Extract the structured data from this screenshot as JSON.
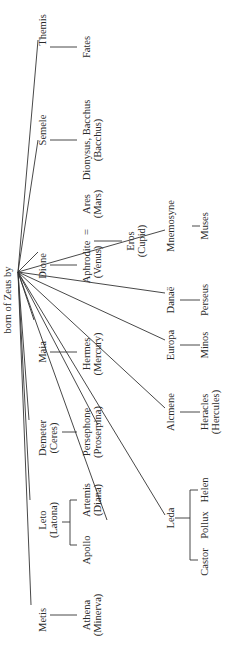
{
  "title": "born of Zeus by",
  "hub": {
    "x": 18,
    "y": 272
  },
  "mothers": [
    {
      "name": "Themis",
      "x": 42,
      "y": 30
    },
    {
      "name": "Semele",
      "x": 42,
      "y": 132
    },
    {
      "name": "Dione",
      "x": 42,
      "y": 246
    },
    {
      "name": "Maia",
      "x": 42,
      "y": 335
    },
    {
      "name": "Demeter",
      "sub": "(Ceres)",
      "x": 42,
      "y": 440
    },
    {
      "name": "Leto",
      "sub": "(Latona)",
      "x": 42,
      "y": 545
    },
    {
      "name": "Metis",
      "x": 42,
      "y": 615
    }
  ],
  "children": {
    "fates": "Fates",
    "dionysus": "Dionysus, Bacchus",
    "dionysus_sub": "(Bacchus)",
    "aphrodite": "Aphrodite",
    "aphrodite_sub": "(Venus)",
    "marriage_sign": "=",
    "ares": "Ares",
    "ares_sub": "(Mars)",
    "eros": "Eros",
    "eros_sub": "(Cupid)",
    "mnemosyne": "Mnemosyne",
    "muses": "Muses",
    "danae": "Danaë",
    "perseus": "Perseus",
    "europa": "Europa",
    "minos": "Minos",
    "hermes": "Hermes",
    "hermes_sub": "(Mercury)",
    "alcmene": "Alcmene",
    "heracles": "Heracles",
    "heracles_sub": "(Hercules)",
    "persephone": "Persephone",
    "persephone_sub": "(Proserpina)",
    "leda": "Leda",
    "castor": "Castor",
    "pollux": "Pollux",
    "helen": "Helen",
    "apollo": "Apollo",
    "artemis": "Artemis",
    "artemis_sub": "(Diana)",
    "athena": "Athena",
    "athena_sub": "(Minerva)"
  }
}
